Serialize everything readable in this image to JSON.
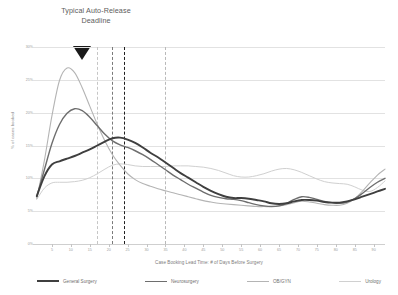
{
  "annotation": {
    "line1": "Typical Auto-Release",
    "line2": "Deadline",
    "marker_icon": "down-triangle-icon",
    "marker_x": 13
  },
  "axes": {
    "y_title": "% of cases booked",
    "x_title": "Case Booking Lead Time: # of Days Before Surgery",
    "y_ticks": [
      "30%",
      "25%",
      "20%",
      "15%",
      "10%",
      "5%",
      "0%"
    ],
    "x_ticks": [
      "5",
      "10",
      "15",
      "20",
      "25",
      "30",
      "35",
      "40",
      "45",
      "50",
      "55",
      "60",
      "65",
      "70",
      "75",
      "80",
      "85",
      "90"
    ]
  },
  "colors": {
    "general_surgery": "#3f3f3f",
    "neurosurgery": "#6e6e6e",
    "obgyn": "#b4b4b4",
    "urology": "#d0d0d0",
    "gridline": "#e2e2e2",
    "marker_dark": "#1a1a1a",
    "marker_mid": "#777777",
    "marker_light": "#b9b9b9",
    "annotation_text": "#5c5c5c"
  },
  "markers": [
    {
      "label": "marker-1",
      "x": 17,
      "color": "#c6c6c6"
    },
    {
      "label": "marker-2",
      "x": 21,
      "color": "#7a7a7a"
    },
    {
      "label": "marker-3",
      "x": 24,
      "color": "#1f1f1f"
    },
    {
      "label": "marker-4",
      "x": 35,
      "color": "#b9b9b9"
    }
  ],
  "legend": [
    {
      "name": "General Surgery",
      "color": "#3f3f3f",
      "width": 2.0
    },
    {
      "name": "Neurosurgery",
      "color": "#6e6e6e",
      "width": 1.5
    },
    {
      "name": "OB/GYN",
      "color": "#b4b4b4",
      "width": 1.2
    },
    {
      "name": "Urology",
      "color": "#d0d0d0",
      "width": 1.0
    }
  ],
  "chart_data": {
    "type": "line",
    "title": "",
    "xlabel": "Case Booking Lead Time: # of Days Before Surgery",
    "ylabel": "% of cases booked",
    "xlim": [
      0,
      93
    ],
    "ylim": [
      0,
      30
    ],
    "grid": true,
    "legend_position": "bottom",
    "annotations": [
      {
        "text": "Typical Auto-Release Deadline",
        "x": 13,
        "type": "marker-triangle"
      }
    ],
    "vlines": [
      {
        "x": 17,
        "style": "dashed",
        "color": "#c6c6c6"
      },
      {
        "x": 21,
        "style": "dashed",
        "color": "#7a7a7a"
      },
      {
        "x": 24,
        "style": "dashed",
        "color": "#1f1f1f"
      },
      {
        "x": 35,
        "style": "dashed",
        "color": "#b9b9b9"
      }
    ],
    "x": [
      1,
      3,
      5,
      7,
      9,
      11,
      13,
      15,
      17,
      19,
      21,
      23,
      25,
      27,
      29,
      31,
      33,
      35,
      37,
      39,
      41,
      43,
      45,
      47,
      49,
      51,
      53,
      55,
      57,
      59,
      61,
      63,
      65,
      67,
      69,
      71,
      73,
      75,
      77,
      79,
      81,
      83,
      85,
      87,
      89,
      91,
      93
    ],
    "series": [
      {
        "name": "General Surgery",
        "color": "#3f3f3f",
        "values": [
          7.3,
          10.3,
          12.1,
          12.6,
          13.0,
          13.4,
          13.9,
          14.4,
          15.0,
          15.6,
          16.1,
          16.2,
          15.9,
          15.4,
          14.7,
          13.9,
          13.2,
          12.4,
          11.6,
          10.8,
          10.1,
          9.4,
          8.7,
          8.1,
          7.6,
          7.2,
          7.0,
          7.0,
          6.9,
          6.7,
          6.5,
          6.2,
          6.1,
          6.2,
          6.5,
          6.7,
          6.7,
          6.6,
          6.4,
          6.3,
          6.3,
          6.5,
          6.8,
          7.2,
          7.6,
          8.0,
          8.4
        ]
      },
      {
        "name": "Neurosurgery",
        "color": "#6e6e6e",
        "values": [
          7.2,
          11.3,
          15.3,
          18.2,
          19.9,
          20.6,
          20.3,
          19.3,
          18.0,
          16.7,
          15.7,
          15.1,
          14.7,
          14.2,
          13.6,
          12.9,
          12.1,
          11.3,
          10.5,
          9.8,
          9.1,
          8.5,
          7.9,
          7.4,
          7.1,
          6.9,
          6.8,
          6.6,
          6.3,
          6.0,
          5.8,
          5.7,
          5.8,
          6.2,
          6.8,
          7.2,
          7.1,
          6.8,
          6.5,
          6.3,
          6.2,
          6.4,
          6.9,
          7.7,
          8.6,
          9.4,
          10.0
        ]
      },
      {
        "name": "OB/GYN",
        "color": "#b4b4b4",
        "values": [
          6.9,
          12.7,
          19.5,
          24.9,
          26.8,
          26.1,
          23.8,
          21.0,
          18.2,
          15.7,
          13.6,
          12.0,
          10.7,
          9.8,
          9.2,
          8.8,
          8.4,
          8.1,
          7.8,
          7.5,
          7.2,
          6.9,
          6.6,
          6.4,
          6.2,
          6.1,
          6.0,
          5.9,
          5.8,
          5.7,
          5.7,
          5.7,
          5.8,
          6.0,
          6.3,
          6.5,
          6.4,
          6.2,
          6.0,
          5.9,
          5.9,
          6.2,
          6.9,
          8.0,
          9.3,
          10.5,
          11.4
        ]
      },
      {
        "name": "Urology",
        "color": "#d0d0d0",
        "values": [
          6.8,
          8.5,
          9.3,
          9.4,
          9.4,
          9.5,
          9.7,
          10.1,
          10.7,
          11.4,
          12.0,
          12.2,
          12.1,
          11.9,
          11.8,
          11.8,
          11.8,
          11.8,
          11.9,
          11.9,
          11.9,
          11.8,
          11.7,
          11.5,
          11.2,
          10.8,
          10.4,
          10.2,
          10.2,
          10.4,
          10.7,
          11.1,
          11.4,
          11.5,
          11.3,
          10.9,
          10.4,
          9.9,
          9.5,
          9.3,
          9.2,
          9.1,
          8.7,
          8.2,
          8.0,
          8.6,
          9.6
        ]
      }
    ]
  }
}
